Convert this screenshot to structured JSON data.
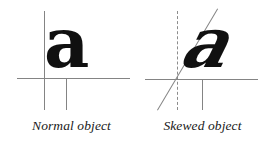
{
  "figure": {
    "width": 275,
    "height": 147,
    "background": "#ffffff",
    "line_color": "#848484",
    "glyph_color": "#101010",
    "caption_color": "#1a1a1a"
  },
  "panels": [
    {
      "id": "normal",
      "caption": "Normal object",
      "glyph": "a",
      "glyph_style": "upright",
      "vertical_axis": {
        "style": "solid",
        "x": 44,
        "y1": 11,
        "y2": 110
      },
      "horizontal_axis": {
        "style": "solid",
        "y": 78,
        "x1": 17,
        "x2": 130
      },
      "stem_guide": {
        "style": "solid",
        "x": 66,
        "y1": 79,
        "y2": 110
      }
    },
    {
      "id": "skewed",
      "caption": "Skewed object",
      "glyph": "a",
      "glyph_style": "skewed",
      "skew_degrees": -26,
      "vertical_axis": {
        "style": "dashed",
        "x": 177,
        "y1": 11,
        "y2": 110
      },
      "horizontal_axis": {
        "style": "solid",
        "y": 79,
        "x1": 145,
        "x2": 258
      },
      "stem_guide": {
        "style": "solid",
        "x": 202,
        "y1": 80,
        "y2": 110
      },
      "diagonal_axis": {
        "style": "solid",
        "x1": 157,
        "y1": 110,
        "x2": 217,
        "y2": 9
      }
    }
  ]
}
